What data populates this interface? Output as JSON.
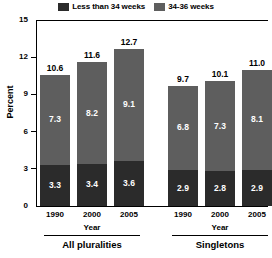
{
  "chart_data": {
    "type": "bar",
    "subtype": "stacked-bar-grouped",
    "title": "",
    "xlabel": "Year",
    "ylabel": "Percent",
    "ylim": [
      0,
      15
    ],
    "yticks": [
      0,
      3,
      6,
      9,
      12,
      15
    ],
    "grid": false,
    "legend_position": "top-center",
    "categories": [
      "1990",
      "2000",
      "2005",
      "1990",
      "2000",
      "2005"
    ],
    "groups": [
      {
        "name": "All pluralities",
        "axis_caption": "Year",
        "categories": [
          "1990",
          "2000",
          "2005"
        ],
        "totals": [
          10.6,
          11.6,
          12.7
        ],
        "series": [
          {
            "name": "Less than 34 weeks",
            "values": [
              3.3,
              3.4,
              3.6
            ]
          },
          {
            "name": "34-36 weeks",
            "values": [
              7.3,
              8.2,
              9.1
            ]
          }
        ]
      },
      {
        "name": "Singletons",
        "axis_caption": "Year",
        "categories": [
          "1990",
          "2000",
          "2005"
        ],
        "totals": [
          9.7,
          10.1,
          11.0
        ],
        "series": [
          {
            "name": "Less than 34 weeks",
            "values": [
              2.9,
              2.8,
              2.9
            ]
          },
          {
            "name": "34-36 weeks",
            "values": [
              6.8,
              7.3,
              8.1
            ]
          }
        ]
      }
    ],
    "series": [
      {
        "name": "Less than 34 weeks",
        "color": "#2b2b2b",
        "values": [
          3.3,
          3.4,
          3.6,
          2.9,
          2.8,
          2.9
        ]
      },
      {
        "name": "34-36 weeks",
        "color": "#5e5e5e",
        "values": [
          7.3,
          8.2,
          9.1,
          6.8,
          7.3,
          8.1
        ]
      }
    ],
    "totals": [
      10.6,
      11.6,
      12.7,
      9.7,
      10.1,
      11.0
    ]
  },
  "legend": {
    "items": [
      {
        "label": "Less than 34 weeks",
        "color": "#2b2b2b"
      },
      {
        "label": "34-36 weeks",
        "color": "#5e5e5e"
      }
    ]
  },
  "axes": {
    "y": {
      "label": "Percent",
      "ticks": [
        "15",
        "12",
        "9",
        "6",
        "3",
        "0"
      ]
    }
  }
}
